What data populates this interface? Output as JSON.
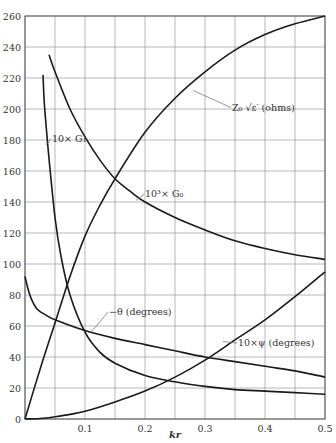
{
  "chart_data": {
    "type": "line",
    "title": "",
    "xlabel": "kr",
    "ylabel": "",
    "xlim": [
      0,
      0.5
    ],
    "ylim": [
      0,
      260
    ],
    "grid": true,
    "x_ticks": [
      {
        "value": 0.1,
        "label": "0.1"
      },
      {
        "value": 0.2,
        "label": "0.2"
      },
      {
        "value": 0.3,
        "label": "0.3"
      },
      {
        "value": 0.4,
        "label": "0.4"
      },
      {
        "value": 0.5,
        "label": "0.5"
      }
    ],
    "y_ticks": [
      0,
      20,
      40,
      60,
      80,
      100,
      120,
      140,
      160,
      180,
      200,
      220,
      240,
      260
    ],
    "x_grid_step": 0.05,
    "y_grid_step": 20,
    "series": [
      {
        "name": "Z0 √ε' (ohms)",
        "label": "Z₀ √ε′ (ohms)",
        "points": [
          [
            0,
            0
          ],
          [
            0.025,
            32
          ],
          [
            0.05,
            62
          ],
          [
            0.075,
            92
          ],
          [
            0.1,
            118
          ],
          [
            0.125,
            138
          ],
          [
            0.15,
            155
          ],
          [
            0.2,
            185
          ],
          [
            0.25,
            207
          ],
          [
            0.3,
            224
          ],
          [
            0.35,
            238
          ],
          [
            0.4,
            248
          ],
          [
            0.45,
            255
          ],
          [
            0.5,
            260
          ]
        ],
        "label_pos": {
          "x": 0.345,
          "y": 199,
          "arrow_to": {
            "x": 0.28,
            "y": 212
          }
        }
      },
      {
        "name": "10^3 × G0",
        "label": "10³× G₀",
        "points": [
          [
            0.04,
            235
          ],
          [
            0.05,
            224
          ],
          [
            0.075,
            200
          ],
          [
            0.1,
            182
          ],
          [
            0.125,
            167
          ],
          [
            0.15,
            155
          ],
          [
            0.175,
            147
          ],
          [
            0.2,
            140
          ],
          [
            0.25,
            130
          ],
          [
            0.3,
            122
          ],
          [
            0.35,
            115
          ],
          [
            0.4,
            110
          ],
          [
            0.45,
            106
          ],
          [
            0.5,
            103
          ]
        ],
        "label_pos": {
          "x": 0.2,
          "y": 143,
          "arrow_to": {
            "x": 0.185,
            "y": 141
          }
        }
      },
      {
        "name": "10 × G1",
        "label": "10× G₁",
        "points": [
          [
            0.03,
            222
          ],
          [
            0.032,
            205
          ],
          [
            0.035,
            190
          ],
          [
            0.04,
            168
          ],
          [
            0.05,
            130
          ],
          [
            0.06,
            105
          ],
          [
            0.075,
            80
          ],
          [
            0.1,
            56
          ],
          [
            0.125,
            43
          ],
          [
            0.15,
            36
          ],
          [
            0.2,
            28
          ],
          [
            0.25,
            24
          ],
          [
            0.3,
            21
          ],
          [
            0.35,
            19
          ],
          [
            0.4,
            18
          ],
          [
            0.45,
            17
          ],
          [
            0.5,
            16
          ]
        ],
        "label_pos": {
          "x": 0.045,
          "y": 179,
          "arrow_to": {
            "x": 0.035,
            "y": 177
          }
        }
      },
      {
        "name": "-θ (degrees)",
        "label": "−θ (degrees)",
        "points": [
          [
            0,
            92
          ],
          [
            0.005,
            84
          ],
          [
            0.01,
            78
          ],
          [
            0.02,
            71
          ],
          [
            0.035,
            67
          ],
          [
            0.05,
            64
          ],
          [
            0.1,
            57
          ],
          [
            0.15,
            52
          ],
          [
            0.2,
            48
          ],
          [
            0.25,
            44
          ],
          [
            0.3,
            40
          ],
          [
            0.35,
            37
          ],
          [
            0.4,
            34
          ],
          [
            0.45,
            31
          ],
          [
            0.5,
            27
          ]
        ],
        "label_pos": {
          "x": 0.14,
          "y": 67,
          "arrow_to": {
            "x": 0.11,
            "y": 56
          }
        }
      },
      {
        "name": "10 × ψ (degrees)",
        "label": "10×ψ (degrees)",
        "points": [
          [
            0,
            0
          ],
          [
            0.025,
            0.3
          ],
          [
            0.05,
            1.5
          ],
          [
            0.075,
            3
          ],
          [
            0.1,
            5
          ],
          [
            0.15,
            11
          ],
          [
            0.2,
            18
          ],
          [
            0.25,
            27
          ],
          [
            0.3,
            38
          ],
          [
            0.35,
            51
          ],
          [
            0.4,
            64
          ],
          [
            0.45,
            79
          ],
          [
            0.5,
            95
          ]
        ],
        "label_pos": {
          "x": 0.355,
          "y": 47,
          "arrow_to": {
            "x": 0.33,
            "y": 50
          }
        }
      }
    ]
  }
}
